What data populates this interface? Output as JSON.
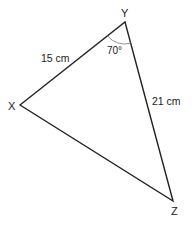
{
  "diagram": {
    "type": "triangle",
    "vertices": {
      "X": {
        "label": "X",
        "x": 20,
        "y": 105
      },
      "Y": {
        "label": "Y",
        "x": 125,
        "y": 22
      },
      "Z": {
        "label": "Z",
        "x": 173,
        "y": 201
      }
    },
    "sides": {
      "XY": {
        "label": "15 cm"
      },
      "YZ": {
        "label": "21 cm"
      }
    },
    "angle_Y": {
      "label": "70°"
    },
    "stroke_color": "#222222"
  }
}
